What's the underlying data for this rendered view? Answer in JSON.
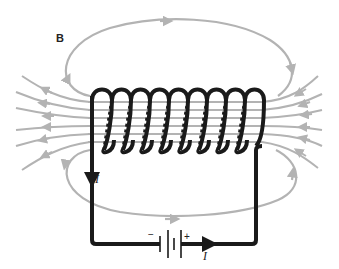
{
  "diagram": {
    "labels": {
      "field": "B",
      "current_left": "I",
      "current_bottom": "I",
      "battery_negative": "−",
      "battery_positive": "+"
    },
    "coil_turns": 9,
    "colors": {
      "field_lines": "#b3b3b3",
      "wire": "#1a1a1a",
      "background": "#ffffff"
    }
  }
}
